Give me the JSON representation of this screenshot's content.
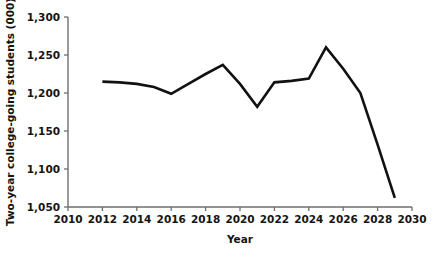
{
  "chart_data": {
    "type": "line",
    "title": "",
    "subtitle": "",
    "xlabel": "Year",
    "ylabel": "Two-year college-going students (000)",
    "xlim": [
      2010,
      2030
    ],
    "ylim": [
      1050,
      1300
    ],
    "grid": false,
    "legend": null,
    "x_ticks": [
      2010,
      2012,
      2014,
      2016,
      2018,
      2020,
      2022,
      2024,
      2026,
      2028,
      2030
    ],
    "x_tick_labels": [
      "2010",
      "2012",
      "2014",
      "2016",
      "2018",
      "2020",
      "2022",
      "2024",
      "2026",
      "2028",
      "2030"
    ],
    "y_ticks": [
      1050,
      1100,
      1150,
      1200,
      1250,
      1300
    ],
    "y_tick_labels": [
      "1,050",
      "1,100",
      "1,150",
      "1,200",
      "1,250",
      "1,300"
    ],
    "series": [
      {
        "name": "Two-year college-going students",
        "color": "#111111",
        "x": [
          2012,
          2013,
          2014,
          2015,
          2016,
          2017,
          2018,
          2019,
          2020,
          2021,
          2022,
          2023,
          2024,
          2025,
          2026,
          2027,
          2028,
          2029
        ],
        "values": [
          1215,
          1214,
          1212,
          1208,
          1199,
          1212,
          1225,
          1237,
          1212,
          1182,
          1214,
          1216,
          1219,
          1260,
          1232,
          1200,
          1132,
          1062
        ]
      }
    ],
    "annotations": []
  },
  "axis": {
    "y_title": "Two-year college-going students (000)",
    "x_title": "Year"
  }
}
